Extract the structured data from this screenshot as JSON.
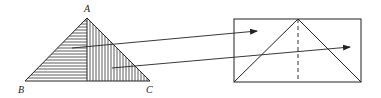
{
  "diagram": {
    "type": "geometric-dissection",
    "triangle": {
      "vertices": {
        "A": {
          "label": "A",
          "x": 87,
          "y": 18
        },
        "B": {
          "label": "B",
          "x": 25,
          "y": 81
        },
        "C": {
          "label": "C",
          "x": 150,
          "y": 81
        }
      },
      "left_half_fill": "horizontal-hatch",
      "right_half_fill": "vertical-hatch"
    },
    "rectangle": {
      "x": 234,
      "y": 19,
      "width": 127,
      "height": 63,
      "inner_triangle_apex_x": 298,
      "center_line_style": "dashed"
    },
    "arrows": [
      {
        "name": "left-half-arrow",
        "from": [
          72,
          48
        ],
        "to": [
          257,
          31
        ]
      },
      {
        "name": "right-half-arrow",
        "from": [
          112,
          68
        ],
        "to": [
          350,
          47
        ]
      }
    ],
    "colors": {
      "line": "#222222",
      "background": "#ffffff"
    }
  }
}
